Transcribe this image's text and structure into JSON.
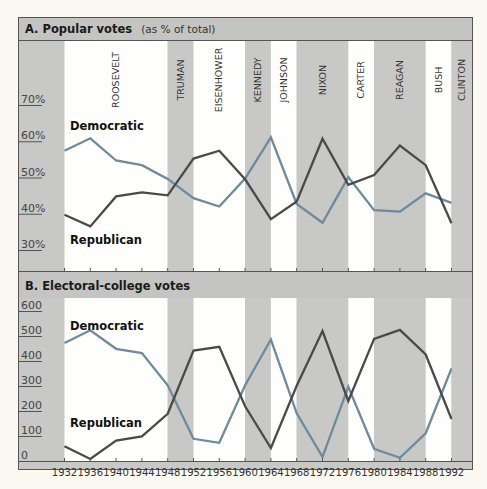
{
  "colors": {
    "background": "#fbf9f1",
    "band_gray": "#c8c8c6",
    "band_white": "#fefefc",
    "header_gray": "#c4c4c2",
    "frame": "#555555",
    "democratic_line": "#6f8a9b",
    "republican_line": "#4a4a4a"
  },
  "presidents": [
    {
      "name": "ROOSEVELT",
      "start": 1932,
      "end": 1948,
      "shade": "white"
    },
    {
      "name": "TRUMAN",
      "start": 1948,
      "end": 1952,
      "shade": "gray"
    },
    {
      "name": "EISENHOWER",
      "start": 1952,
      "end": 1960,
      "shade": "white"
    },
    {
      "name": "KENNEDY",
      "start": 1960,
      "end": 1964,
      "shade": "gray"
    },
    {
      "name": "JOHNSON",
      "start": 1964,
      "end": 1968,
      "shade": "white"
    },
    {
      "name": "NIXON",
      "start": 1968,
      "end": 1976,
      "shade": "gray"
    },
    {
      "name": "CARTER",
      "start": 1976,
      "end": 1980,
      "shade": "white"
    },
    {
      "name": "REAGAN",
      "start": 1980,
      "end": 1988,
      "shade": "gray"
    },
    {
      "name": "BUSH",
      "start": 1988,
      "end": 1992,
      "shade": "white"
    },
    {
      "name": "CLINTON",
      "start": 1992,
      "end": 1996,
      "shade": "gray"
    }
  ],
  "chart_data": [
    {
      "type": "line",
      "title": "A. Popular votes",
      "subtitle": "(as % of total)",
      "xlabel": "",
      "ylabel": "",
      "x": [
        1932,
        1936,
        1940,
        1944,
        1948,
        1952,
        1956,
        1960,
        1964,
        1968,
        1972,
        1976,
        1980,
        1984,
        1988,
        1992
      ],
      "ylim": [
        27,
        73
      ],
      "yticks": [
        30,
        40,
        50,
        60,
        70
      ],
      "ytick_labels": [
        "30%",
        "40%",
        "50%",
        "60%",
        "70%"
      ],
      "grid": false,
      "series": [
        {
          "name": "Democratic",
          "values": [
            57.4,
            60.8,
            54.7,
            53.4,
            49.6,
            44.3,
            42.0,
            49.7,
            61.1,
            42.7,
            37.5,
            50.1,
            41.0,
            40.6,
            45.6,
            43.0
          ]
        },
        {
          "name": "Republican",
          "values": [
            39.7,
            36.5,
            44.8,
            45.9,
            45.1,
            55.2,
            57.4,
            49.5,
            38.5,
            43.4,
            60.7,
            48.0,
            50.7,
            58.8,
            53.4,
            37.4
          ]
        }
      ],
      "annotations": [
        {
          "text": "Democratic",
          "near": "top-left"
        },
        {
          "text": "Republican",
          "near": "bottom-left"
        }
      ]
    },
    {
      "type": "line",
      "title": "B. Electoral-college votes",
      "subtitle": "",
      "xlabel": "",
      "ylabel": "",
      "x": [
        1932,
        1936,
        1940,
        1944,
        1948,
        1952,
        1956,
        1960,
        1964,
        1968,
        1972,
        1976,
        1980,
        1984,
        1988,
        1992
      ],
      "xtick_labels": [
        "1932",
        "1936",
        "1940",
        "1944",
        "1948",
        "1952",
        "1956",
        "1960",
        "1964",
        "1968",
        "1972",
        "1976",
        "1980",
        "1984",
        "1988",
        "1992"
      ],
      "ylim": [
        0,
        630
      ],
      "yticks": [
        0,
        100,
        200,
        300,
        400,
        500,
        600
      ],
      "ytick_labels": [
        "0",
        "100",
        "200",
        "300",
        "400",
        "500",
        "600"
      ],
      "grid": false,
      "series": [
        {
          "name": "Democratic",
          "values": [
            472,
            523,
            449,
            432,
            303,
            89,
            73,
            303,
            486,
            191,
            17,
            297,
            49,
            13,
            111,
            370
          ]
        },
        {
          "name": "Republican",
          "values": [
            59,
            8,
            82,
            99,
            189,
            442,
            457,
            219,
            52,
            301,
            520,
            240,
            489,
            525,
            426,
            168
          ]
        }
      ],
      "annotations": [
        {
          "text": "Democratic",
          "near": "top-left"
        },
        {
          "text": "Republican",
          "near": "bottom-left"
        }
      ]
    }
  ]
}
